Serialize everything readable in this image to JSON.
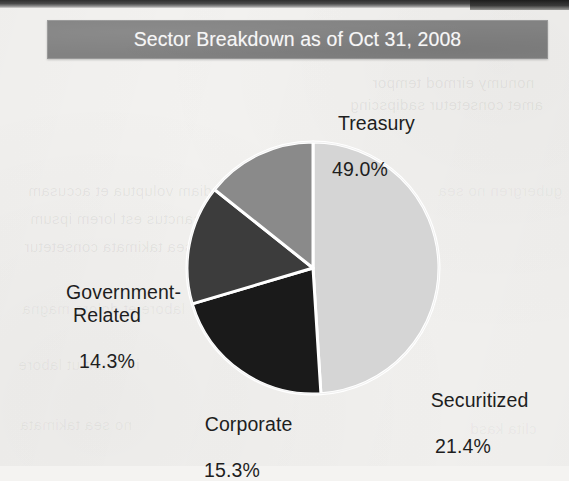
{
  "title": {
    "text": "Sector Breakdown as of Oct 31, 2008"
  },
  "colors": {
    "title_band": "#828282",
    "page_background": "#f3f2f0",
    "label_text": "#1e1e1e",
    "title_text": "#f6f6f6",
    "separator": "#ffffff"
  },
  "chart_data": {
    "type": "pie",
    "title": "Sector Breakdown as of Oct 31, 2008",
    "xlabel": "",
    "ylabel": "",
    "units": "percent",
    "legend_position": "none",
    "labels_outside": true,
    "start_angle_deg": 0,
    "direction": "clockwise",
    "categories": [
      "Treasury",
      "Securitized",
      "Corporate",
      "Government-Related"
    ],
    "values": [
      49.0,
      21.4,
      15.3,
      14.3
    ],
    "value_labels": [
      "49.0%",
      "21.4%",
      "15.3%",
      "14.3%"
    ],
    "colors": [
      "#d5d5d5",
      "#1a1a1a",
      "#3c3c3c",
      "#8a8a8a"
    ],
    "slices": [
      {
        "name": "Treasury",
        "value": 49.0,
        "label": "Treasury",
        "value_label": "49.0%",
        "color": "#d5d5d5"
      },
      {
        "name": "Securitized",
        "value": 21.4,
        "label": "Securitized",
        "value_label": "21.4%",
        "color": "#1a1a1a"
      },
      {
        "name": "Corporate",
        "value": 15.3,
        "label": "Corporate",
        "value_label": "15.3%",
        "color": "#3c3c3c"
      },
      {
        "name": "Government-Related",
        "value": 14.3,
        "label": "Government-\nRelated",
        "value_label": "14.3%",
        "color": "#8a8a8a"
      }
    ],
    "total": 100.0
  },
  "ghost_text": [
    {
      "t": "nonumy eirmod tempor",
      "x": 372,
      "y": 74,
      "s": 15,
      "o": 0.08
    },
    {
      "t": "amet consetetur sadipscing",
      "x": 350,
      "y": 96,
      "s": 15,
      "o": 0.08
    },
    {
      "t": "diam voluptua et accusam",
      "x": 28,
      "y": 182,
      "s": 15,
      "o": 0.07
    },
    {
      "t": "sanctus est lorem ipsum",
      "x": 30,
      "y": 210,
      "s": 15,
      "o": 0.07
    },
    {
      "t": "sea takimata consetetur",
      "x": 24,
      "y": 238,
      "s": 15,
      "o": 0.07
    },
    {
      "t": "labore et dolore magna",
      "x": 22,
      "y": 300,
      "s": 15,
      "o": 0.06
    },
    {
      "t": "invidunt ut labore",
      "x": 18,
      "y": 356,
      "s": 15,
      "o": 0.06
    },
    {
      "t": "no sea takimata",
      "x": 20,
      "y": 416,
      "s": 15,
      "o": 0.06
    },
    {
      "t": "gubergren no sea",
      "x": 438,
      "y": 182,
      "s": 15,
      "o": 0.05
    },
    {
      "t": "clita kasd",
      "x": 470,
      "y": 420,
      "s": 15,
      "o": 0.05
    }
  ]
}
